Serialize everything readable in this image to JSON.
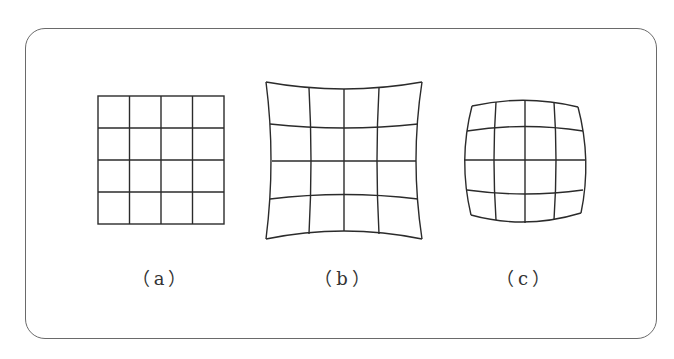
{
  "figure": {
    "panels": [
      {
        "id": "a",
        "label": "（a）",
        "description": "undistorted square grid",
        "rows": 4,
        "cols": 4
      },
      {
        "id": "b",
        "label": "（b）",
        "description": "pincushion distortion grid",
        "rows": 4,
        "cols": 4
      },
      {
        "id": "c",
        "label": "（c）",
        "description": "barrel distortion grid",
        "rows": 4,
        "cols": 4
      }
    ],
    "colors": {
      "line": "#2b2b2b",
      "frame": "#6a6a6a",
      "background": "#ffffff"
    }
  }
}
